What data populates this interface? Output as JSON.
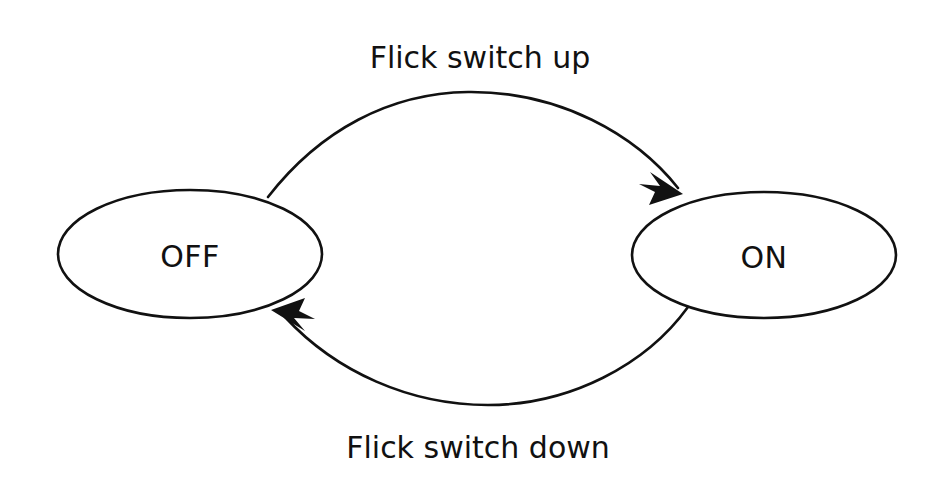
{
  "diagram": {
    "type": "finite-state-machine",
    "background_color": "#ffffff",
    "stroke_color": "#111111",
    "text_color": "#111111",
    "states": [
      {
        "id": "off",
        "label": "OFF",
        "cx": 190,
        "cy": 254,
        "rx": 132,
        "ry": 64
      },
      {
        "id": "on",
        "label": "ON",
        "cx": 764,
        "cy": 255,
        "rx": 132,
        "ry": 63
      }
    ],
    "transitions": [
      {
        "id": "off-to-on",
        "label": "Flick switch up",
        "from": "off",
        "to": "on",
        "label_x": 480,
        "label_y": 68
      },
      {
        "id": "on-to-off",
        "label": "Flick switch down",
        "from": "on",
        "to": "off",
        "label_x": 478,
        "label_y": 458
      }
    ]
  }
}
